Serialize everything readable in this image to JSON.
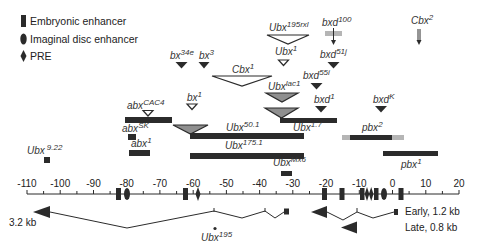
{
  "legend": {
    "items": [
      {
        "label": "Embryonic enhancer",
        "shape": "rect"
      },
      {
        "label": "Imaginal disc enhancer",
        "shape": "ellipse"
      },
      {
        "label": "PRE",
        "shape": "diamond"
      }
    ]
  },
  "alleles": {
    "ubx195rxl": {
      "base": "Ubx",
      "sup": "195rxl",
      "marker": "open-triangle-large"
    },
    "bxd100": {
      "base": "bxd",
      "sup": "100",
      "marker": "gray-bar-arrow"
    },
    "cbx2": {
      "base": "Cbx",
      "sup": "2",
      "marker": "arrow"
    },
    "ubx1": {
      "base": "Ubx",
      "sup": "1",
      "marker": "open-triangle"
    },
    "bxd51j": {
      "base": "bxd",
      "sup": "51j",
      "marker": "filled-triangle"
    },
    "bx34e": {
      "base": "bx",
      "sup": "34e",
      "marker": "filled-triangle"
    },
    "bx3": {
      "base": "bx",
      "sup": "3",
      "marker": "filled-triangle"
    },
    "cbx1": {
      "base": "Cbx",
      "sup": "1",
      "marker": "open-triangle-large"
    },
    "bxd55i": {
      "base": "bxd",
      "sup": "55i",
      "marker": "filled-triangle"
    },
    "ubxlac1": {
      "base": "Ubx",
      "sup": "lac1",
      "marker": "gray-triangle"
    },
    "bx1": {
      "base": "bx",
      "sup": "1",
      "marker": "open-triangle"
    },
    "abxCAC4": {
      "base": "abx",
      "sup": "CAC4",
      "marker": "open-triangle"
    },
    "bxd1": {
      "base": "bxd",
      "sup": "1",
      "marker": "filled-triangle"
    },
    "bxdK": {
      "base": "bxd",
      "sup": "K",
      "marker": "filled-triangle"
    },
    "ubx1_7": {
      "base": "Ubx",
      "sup": "1.7",
      "marker": "deletion-bar"
    },
    "ubx50_1": {
      "base": "Ubx",
      "sup": "50.1",
      "marker": "deletion-bar"
    },
    "abxSK": {
      "base": "abx",
      "sup": "SK",
      "marker": "deletion-bar"
    },
    "pbx2": {
      "base": "pbx",
      "sup": "2",
      "marker": "deletion-bar"
    },
    "abx1": {
      "base": "abx",
      "sup": "1",
      "marker": "deletion-bar"
    },
    "ubx175_1": {
      "base": "Ubx",
      "sup": "175.1",
      "marker": "deletion-bar"
    },
    "ubx9_22": {
      "base": "Ubx",
      "sup": "9.22",
      "marker": "deletion-box"
    },
    "pbx1": {
      "base": "pbx",
      "sup": "1",
      "marker": "deletion-bar"
    },
    "ubxMx6": {
      "base": "Ubx",
      "sup": "Mx6",
      "marker": "deletion-box"
    },
    "ubx195": {
      "base": "Ubx",
      "sup": "195",
      "marker": "dot"
    }
  },
  "axis": {
    "ticks": [
      "-110",
      "-100",
      "-90",
      "-80",
      "-70",
      "-60",
      "-50",
      "-40",
      "-30",
      "-20",
      "-10",
      "0",
      "10",
      "20"
    ],
    "min": -110,
    "max": 20,
    "minor_step": 5
  },
  "transcripts": {
    "long": {
      "label": "3.2 kb"
    },
    "early": {
      "label": "Early, 1.2 kb"
    },
    "late": {
      "label": "Late, 0.8 kb"
    }
  },
  "colors": {
    "dark": "#2b2b2b",
    "gray": "#9a9a9a",
    "light_gray": "#b5b5b5"
  }
}
